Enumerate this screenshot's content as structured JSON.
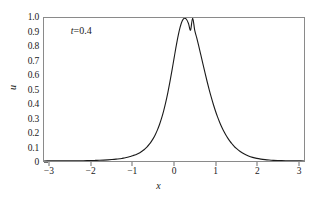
{
  "chart_data": {
    "type": "line",
    "title": "",
    "xlabel": "x",
    "ylabel": "u",
    "xlim": [
      -3.14159,
      3.14159
    ],
    "ylim": [
      0,
      1.0
    ],
    "grid": false,
    "legend": null,
    "annotations": [
      {
        "text": "t=0.4",
        "var": "t",
        "rest": "=0.4",
        "x": -2.5,
        "y": 0.91
      }
    ],
    "xticks": [
      -3,
      -2,
      -1,
      0,
      1,
      2,
      3
    ],
    "xtick_labels": [
      "−3",
      "−2",
      "−1",
      "0",
      "1",
      "2",
      "3"
    ],
    "yticks": [
      0,
      0.1,
      0.2,
      0.3,
      0.4,
      0.5,
      0.6,
      0.7,
      0.8,
      0.9,
      1.0
    ],
    "ytick_labels": [
      "0",
      "0.1",
      "0.2",
      "0.3",
      "0.4",
      "0.5",
      "0.6",
      "0.7",
      "0.8",
      "0.9",
      "1.0"
    ],
    "series": [
      {
        "name": "u(x, t=0.4)",
        "color": "#1a1a1a",
        "line_width": 1.1,
        "peak_x": 0.45,
        "peak_y": 1.0,
        "half_width": 0.4,
        "x": [
          -3.14159,
          -3.0,
          -2.9,
          -2.8,
          -2.7,
          -2.6,
          -2.5,
          -2.4,
          -2.3,
          -2.2,
          -2.1,
          -2.0,
          -1.9,
          -1.8,
          -1.7,
          -1.6,
          -1.5,
          -1.4,
          -1.3,
          -1.25,
          -1.2,
          -1.15,
          -1.1,
          -1.05,
          -1.0,
          -0.95,
          -0.9,
          -0.85,
          -0.8,
          -0.75,
          -0.7,
          -0.65,
          -0.6,
          -0.55,
          -0.5,
          -0.45,
          -0.4,
          -0.35,
          -0.3,
          -0.25,
          -0.2,
          -0.15,
          -0.1,
          -0.05,
          0.0,
          0.05,
          0.1,
          0.15,
          0.2,
          0.25,
          0.3,
          0.35,
          0.4,
          0.45,
          0.5,
          0.55,
          0.6,
          0.65,
          0.7,
          0.75,
          0.8,
          0.85,
          0.9,
          0.95,
          1.0,
          1.05,
          1.1,
          1.15,
          1.2,
          1.25,
          1.3,
          1.35,
          1.4,
          1.45,
          1.5,
          1.6,
          1.7,
          1.8,
          1.9,
          2.0,
          2.1,
          2.2,
          2.3,
          2.4,
          2.5,
          2.6,
          2.7,
          2.8,
          2.9,
          3.0,
          3.14159
        ],
        "y": [
          0.0005,
          0.0006,
          0.0007,
          0.0008,
          0.0009,
          0.001,
          0.0012,
          0.0015,
          0.0018,
          0.0022,
          0.0027,
          0.0033,
          0.0041,
          0.0051,
          0.0064,
          0.008,
          0.0101,
          0.0128,
          0.0163,
          0.0185,
          0.0211,
          0.024,
          0.0274,
          0.0314,
          0.036,
          0.0413,
          0.0476,
          0.0549,
          0.0635,
          0.0735,
          0.0853,
          0.0993,
          0.1158,
          0.1353,
          0.1583,
          0.1855,
          0.2176,
          0.2553,
          0.2995,
          0.3508,
          0.4099,
          0.4769,
          0.5515,
          0.6321,
          0.7161,
          0.7992,
          0.8755,
          0.9382,
          0.9806,
          0.9985,
          0.9912,
          0.9616,
          0.9156,
          0.9995,
          0.9156,
          0.8607,
          0.8013,
          0.7395,
          0.6771,
          0.6155,
          0.5559,
          0.4992,
          0.446,
          0.3967,
          0.3515,
          0.3104,
          0.2733,
          0.24,
          0.2102,
          0.1836,
          0.16,
          0.139,
          0.1205,
          0.1042,
          0.0898,
          0.0663,
          0.0486,
          0.0353,
          0.0255,
          0.0183,
          0.0131,
          0.0093,
          0.0066,
          0.0047,
          0.0033,
          0.0024,
          0.0017,
          0.0012,
          0.0009,
          0.0007,
          0.0005
        ]
      }
    ]
  }
}
